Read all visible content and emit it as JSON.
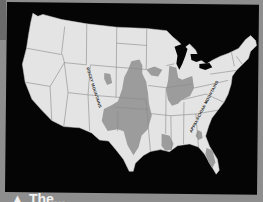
{
  "map": {
    "title": "United States physical map with shaded regions",
    "labels": [
      {
        "id": "rocky",
        "text": "ROCKY MOUNTAINS"
      },
      {
        "id": "appalachian",
        "text": "APPALACHIAN MOUNTAINS"
      }
    ],
    "colors": {
      "background": "#050505",
      "land": "#e4e4e4",
      "borders": "#7a7a7a",
      "shaded_region": "#9c9c9c",
      "page": "#8e8e8e"
    }
  },
  "caption": {
    "marker": "▲",
    "text": "The..."
  }
}
